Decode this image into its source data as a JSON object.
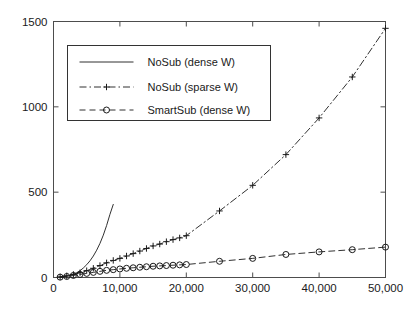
{
  "figure": {
    "title": "",
    "background": "#ffffff",
    "axis_color": "#4d4d4d",
    "series_color": "#1a1a1a"
  },
  "axes": {
    "x_ticks": [
      "0",
      "10,000",
      "20,000",
      "30,000",
      "40,000",
      "50,000"
    ],
    "y_ticks": [
      "0",
      "500",
      "1000",
      "1500"
    ],
    "xlabel": "",
    "ylabel": ""
  },
  "legend": {
    "items": [
      {
        "label": "NoSub (dense W)",
        "style": "solid",
        "marker": "none"
      },
      {
        "label": "NoSub (sparse W)",
        "style": "dashdot",
        "marker": "plus"
      },
      {
        "label": "SmartSub (dense W)",
        "style": "dashed",
        "marker": "circle"
      }
    ]
  },
  "chart_data": {
    "type": "line",
    "title": "",
    "xlabel": "",
    "ylabel": "",
    "xlim": [
      0,
      50000
    ],
    "ylim": [
      0,
      1500
    ],
    "xticks": [
      0,
      10000,
      20000,
      30000,
      40000,
      50000
    ],
    "yticks": [
      0,
      500,
      1000,
      1500
    ],
    "xtick_labels": [
      "0",
      "10,000",
      "20,000",
      "30,000",
      "40,000",
      "50,000"
    ],
    "ytick_labels": [
      "0",
      "500",
      "1000",
      "1500"
    ],
    "grid": false,
    "legend_position": "upper left inside",
    "series": [
      {
        "name": "NoSub (dense W)",
        "linestyle": "solid",
        "marker": "none",
        "x": [
          1000,
          1500,
          2000,
          2500,
          3000,
          3500,
          4000,
          4500,
          5000,
          5500,
          6000,
          6500,
          7000,
          7500,
          8000,
          8500,
          9000
        ],
        "y": [
          2,
          4,
          7,
          12,
          19,
          28,
          40,
          56,
          75,
          98,
          126,
          160,
          200,
          248,
          305,
          370,
          428
        ]
      },
      {
        "name": "NoSub (sparse W)",
        "linestyle": "dashdot",
        "marker": "plus",
        "x": [
          1000,
          2000,
          3000,
          4000,
          5000,
          6000,
          7000,
          8000,
          9000,
          10000,
          11000,
          12000,
          13000,
          14000,
          15000,
          16000,
          17000,
          18000,
          19000,
          20000,
          25000,
          30000,
          35000,
          40000,
          45000,
          50000
        ],
        "y": [
          4,
          10,
          18,
          28,
          40,
          54,
          70,
          86,
          100,
          112,
          126,
          140,
          155,
          170,
          185,
          196,
          210,
          222,
          232,
          245,
          390,
          540,
          720,
          935,
          1175,
          1460
        ]
      },
      {
        "name": "SmartSub (dense W)",
        "linestyle": "dashed",
        "marker": "circle",
        "x": [
          1000,
          2000,
          3000,
          4000,
          5000,
          6000,
          7000,
          8000,
          9000,
          10000,
          11000,
          12000,
          13000,
          14000,
          15000,
          16000,
          17000,
          18000,
          19000,
          20000,
          25000,
          30000,
          35000,
          40000,
          45000,
          50000
        ],
        "y": [
          2,
          6,
          12,
          18,
          24,
          30,
          36,
          42,
          46,
          50,
          54,
          57,
          60,
          63,
          66,
          68,
          70,
          72,
          74,
          76,
          95,
          112,
          135,
          150,
          163,
          178
        ]
      }
    ]
  }
}
